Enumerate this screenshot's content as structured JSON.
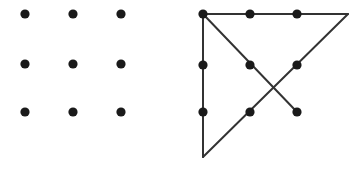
{
  "figure": {
    "name": "nine-dots-puzzle",
    "width": 364,
    "height": 170,
    "background_color": "#ffffff",
    "dot_color": "#1a1a1a",
    "line_color": "#333333",
    "dot_radius": 4.6,
    "line_width": 2
  },
  "panels": [
    {
      "id": "unsolved-grid",
      "label": "nine dot grid",
      "dots": [
        {
          "id": "r1c1",
          "x": 25,
          "y": 14
        },
        {
          "id": "r1c2",
          "x": 73,
          "y": 14
        },
        {
          "id": "r1c3",
          "x": 121,
          "y": 14
        },
        {
          "id": "r2c1",
          "x": 25,
          "y": 64
        },
        {
          "id": "r2c2",
          "x": 73,
          "y": 64
        },
        {
          "id": "r2c3",
          "x": 121,
          "y": 64
        },
        {
          "id": "r3c1",
          "x": 25,
          "y": 112
        },
        {
          "id": "r3c2",
          "x": 73,
          "y": 112
        },
        {
          "id": "r3c3",
          "x": 121,
          "y": 112
        }
      ],
      "lines": []
    },
    {
      "id": "solved-grid",
      "label": "nine dot grid with four line solution",
      "dots": [
        {
          "id": "r1c1",
          "x": 203,
          "y": 14
        },
        {
          "id": "r1c2",
          "x": 250,
          "y": 14
        },
        {
          "id": "r1c3",
          "x": 297,
          "y": 14
        },
        {
          "id": "r2c1",
          "x": 203,
          "y": 65
        },
        {
          "id": "r2c2",
          "x": 250,
          "y": 65
        },
        {
          "id": "r2c3",
          "x": 297,
          "y": 65
        },
        {
          "id": "r3c1",
          "x": 203,
          "y": 112
        },
        {
          "id": "r3c2",
          "x": 250,
          "y": 112
        },
        {
          "id": "r3c3",
          "x": 297,
          "y": 112
        }
      ],
      "solution_path": [
        {
          "x": 297,
          "y": 112
        },
        {
          "x": 203,
          "y": 14
        },
        {
          "x": 348,
          "y": 14
        },
        {
          "x": 203,
          "y": 157
        },
        {
          "x": 203,
          "y": 14
        }
      ],
      "lines": [
        {
          "id": "line-1-diagonal-up-left",
          "x1": 297,
          "y1": 112,
          "x2": 203,
          "y2": 14
        },
        {
          "id": "line-2-horizontal-right",
          "x1": 203,
          "y1": 14,
          "x2": 348,
          "y2": 14
        },
        {
          "id": "line-3-diagonal-down-left",
          "x1": 348,
          "y1": 14,
          "x2": 203,
          "y2": 157
        },
        {
          "id": "line-4-vertical-up",
          "x1": 203,
          "y1": 157,
          "x2": 203,
          "y2": 14
        }
      ]
    }
  ]
}
